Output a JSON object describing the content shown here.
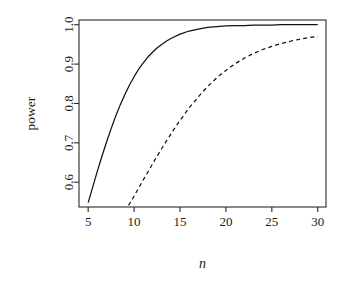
{
  "chart_data": {
    "type": "line",
    "title": "",
    "xlabel": "n",
    "ylabel": "power",
    "xlim": [
      4.0,
      30.9
    ],
    "ylim": [
      0.537,
      1.012
    ],
    "grid": false,
    "legend": "none",
    "xticks": [
      5,
      10,
      15,
      20,
      25,
      30
    ],
    "xtick_labels": [
      "5",
      "10",
      "15",
      "20",
      "25",
      "30"
    ],
    "yticks": [
      0.6,
      0.7,
      0.8,
      0.9,
      1.0
    ],
    "ytick_labels": [
      "0.6",
      "0.7",
      "0.8",
      "0.9",
      "1.0"
    ],
    "series": [
      {
        "name": "solid-curve",
        "style": "solid",
        "color": "#111111",
        "x": [
          5,
          5.5,
          6,
          6.5,
          7,
          7.5,
          8,
          8.5,
          9,
          9.5,
          10,
          10.5,
          11,
          11.5,
          12,
          12.5,
          13,
          13.5,
          14,
          15,
          16,
          17,
          18,
          19,
          20,
          21,
          22,
          23,
          24,
          25,
          26,
          27,
          28,
          29,
          30
        ],
        "values": [
          0.548,
          0.588,
          0.628,
          0.666,
          0.702,
          0.736,
          0.768,
          0.797,
          0.823,
          0.847,
          0.868,
          0.887,
          0.903,
          0.918,
          0.93,
          0.941,
          0.95,
          0.958,
          0.965,
          0.976,
          0.984,
          0.989,
          0.993,
          0.995,
          0.997,
          0.998,
          0.998,
          0.999,
          0.999,
          0.999,
          1.0,
          1.0,
          1.0,
          1.0,
          1.0
        ]
      },
      {
        "name": "dashed-curve",
        "style": "dashed",
        "color": "#111111",
        "x": [
          9.4,
          10,
          10.5,
          11,
          11.5,
          12,
          12.5,
          13,
          13.5,
          14,
          14.5,
          15,
          15.5,
          16,
          16.5,
          17,
          17.5,
          18,
          18.5,
          19,
          19.5,
          20,
          21,
          22,
          23,
          24,
          25,
          26,
          27,
          28,
          29,
          30
        ],
        "values": [
          0.541,
          0.565,
          0.585,
          0.606,
          0.626,
          0.646,
          0.666,
          0.685,
          0.704,
          0.722,
          0.74,
          0.757,
          0.773,
          0.789,
          0.803,
          0.817,
          0.83,
          0.843,
          0.854,
          0.865,
          0.875,
          0.884,
          0.901,
          0.915,
          0.927,
          0.937,
          0.945,
          0.952,
          0.958,
          0.963,
          0.967,
          0.97
        ]
      }
    ]
  },
  "geometry": {
    "plot_left": 79,
    "plot_right": 326,
    "plot_top": 20,
    "plot_bottom": 207,
    "tick_length": 5
  }
}
